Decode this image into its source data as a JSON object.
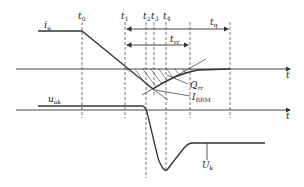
{
  "colors": {
    "line": "#333333",
    "dashed": "#555555",
    "text": "#222222",
    "background": "#ffffff"
  },
  "labels": {
    "current": {
      "main": "i",
      "sub": "a"
    },
    "voltage": {
      "main": "u",
      "sub": "ak"
    },
    "t0": {
      "main": "t",
      "sub": "0"
    },
    "t1": {
      "main": "t",
      "sub": "1"
    },
    "t2": {
      "main": "t",
      "sub": "2"
    },
    "t3": {
      "main": "t",
      "sub": "3"
    },
    "t4": {
      "main": "t",
      "sub": "4"
    },
    "tq": {
      "main": "t",
      "sub": "q"
    },
    "trr": {
      "main": "t",
      "sub": "rr"
    },
    "Qrr": {
      "main": "Q",
      "sub": "rr"
    },
    "IRRM": {
      "main": "I",
      "sub": "RRM"
    },
    "Uk": {
      "main": "U",
      "sub": "k"
    },
    "t_axis_top": "t",
    "t_axis_bottom": "t"
  }
}
